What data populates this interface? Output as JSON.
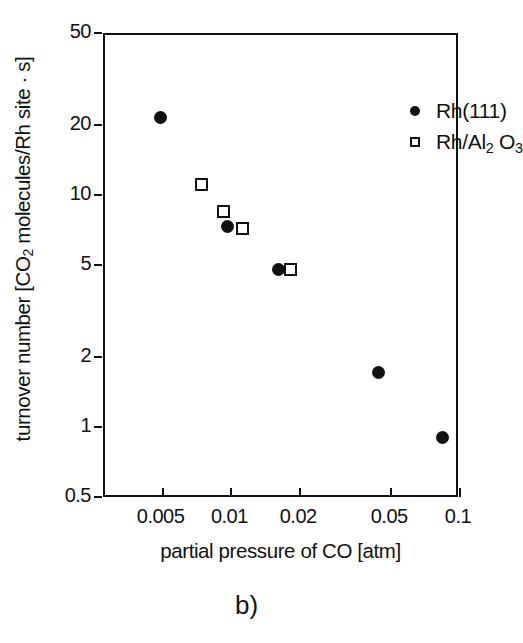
{
  "figure": {
    "panel_caption": "b)",
    "background_color": "#ffffff",
    "ink_color": "#111111"
  },
  "chart_data": {
    "type": "scatter",
    "title": "",
    "xlabel": "partial pressure of CO [atm]",
    "ylabel": "turnover number [CO₂ molecules/Rh site · s]",
    "ylabel_parts": {
      "pre": "turnover number [CO",
      "sub": "2",
      "post": " molecules/Rh site · s]"
    },
    "xscale": "log",
    "yscale": "log",
    "xlim": [
      0.0028,
      0.1
    ],
    "ylim": [
      0.5,
      50
    ],
    "grid": false,
    "legend_position": "top-right",
    "xticks": [
      {
        "value": 0.005,
        "label": "0.005"
      },
      {
        "value": 0.01,
        "label": "0.01"
      },
      {
        "value": 0.02,
        "label": "0.02"
      },
      {
        "value": 0.05,
        "label": "0.05"
      },
      {
        "value": 0.1,
        "label": "0.1"
      }
    ],
    "yticks": [
      {
        "value": 50,
        "label": "50"
      },
      {
        "value": 20,
        "label": "20"
      },
      {
        "value": 10,
        "label": "10"
      },
      {
        "value": 5,
        "label": "5"
      },
      {
        "value": 2,
        "label": "2"
      },
      {
        "value": 1,
        "label": "1"
      },
      {
        "value": 0.5,
        "label": "0.5"
      }
    ],
    "series": [
      {
        "name": "Rh(111)",
        "marker": "filled-circle",
        "color": "#111111",
        "points": [
          {
            "x": 0.0049,
            "y": 22.0
          },
          {
            "x": 0.0096,
            "y": 7.5
          },
          {
            "x": 0.016,
            "y": 4.9
          },
          {
            "x": 0.044,
            "y": 1.75
          },
          {
            "x": 0.084,
            "y": 0.92
          }
        ]
      },
      {
        "name": "Rh/Al₂O₃",
        "marker": "open-square",
        "color": "#111111",
        "points": [
          {
            "x": 0.0074,
            "y": 11.3
          },
          {
            "x": 0.0092,
            "y": 8.7
          },
          {
            "x": 0.0112,
            "y": 7.3
          },
          {
            "x": 0.0182,
            "y": 4.9
          }
        ]
      }
    ]
  },
  "legend": {
    "entries": [
      {
        "marker": "filled-circle",
        "label": "Rh(111)",
        "label_pre": "Rh(111)",
        "label_sub1": "",
        "label_mid": "",
        "label_sub2": ""
      },
      {
        "marker": "open-square",
        "label": "Rh/Al2O3",
        "label_pre": "Rh/Al",
        "label_sub1": "2",
        "label_mid": " O",
        "label_sub2": "3"
      }
    ]
  }
}
